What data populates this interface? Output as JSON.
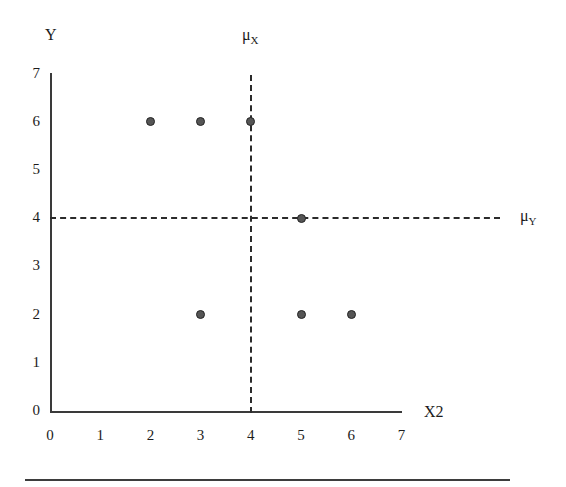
{
  "figure": {
    "background_color": "#ffffff",
    "axis_color": "#3a3a3a",
    "marker_fill_color": "#555555",
    "marker_edge_color": "#242424",
    "dash_color": "#2b2b2b"
  },
  "chart_data": {
    "type": "scatter",
    "title": "",
    "xlabel": "X2",
    "ylabel": "Y",
    "xlim": [
      0,
      7
    ],
    "ylim": [
      0,
      7
    ],
    "grid": false,
    "legend": null,
    "xticks": [
      "0",
      "1",
      "2",
      "3",
      "4",
      "5",
      "6",
      "7"
    ],
    "yticks": [
      "0",
      "1",
      "2",
      "3",
      "4",
      "5",
      "6",
      "7"
    ],
    "x": [
      2,
      3,
      4,
      3,
      5,
      5,
      6
    ],
    "y": [
      6,
      6,
      6,
      2,
      4,
      2,
      2
    ],
    "points": [
      {
        "x": 2,
        "y": 6
      },
      {
        "x": 3,
        "y": 6
      },
      {
        "x": 4,
        "y": 6
      },
      {
        "x": 3,
        "y": 2
      },
      {
        "x": 5,
        "y": 4
      },
      {
        "x": 5,
        "y": 2
      },
      {
        "x": 6,
        "y": 2
      }
    ],
    "annotations": [
      {
        "name": "mean-x",
        "label": "μX",
        "label_base": "μ",
        "label_sub": "X",
        "type": "vline",
        "value": 4
      },
      {
        "name": "mean-y",
        "label": "μY",
        "label_base": "μ",
        "label_sub": "Y",
        "type": "hline",
        "value": 4
      }
    ]
  },
  "footer": {
    "rule": true
  }
}
